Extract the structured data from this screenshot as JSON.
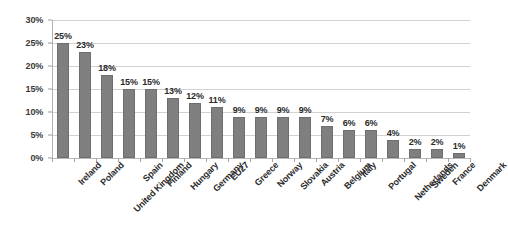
{
  "chart_data": {
    "type": "bar",
    "title": "",
    "subtitle": "",
    "xlabel": "",
    "ylabel": "",
    "ylim": [
      0,
      30
    ],
    "ytick_labels": [
      "0%",
      "5%",
      "10%",
      "15%",
      "20%",
      "25%",
      "30%"
    ],
    "ytick_values": [
      0,
      5,
      10,
      15,
      20,
      25,
      30
    ],
    "grid": true,
    "legend": null,
    "value_suffix": "%",
    "categories": [
      "Ireland",
      "Poland",
      "United Kingdom",
      "Spain",
      "Finland",
      "Hungary",
      "Germany",
      "EU27",
      "Greece",
      "Norway",
      "Slovakia",
      "Austria",
      "Belgium",
      "Italy",
      "Portugal",
      "Netherlands",
      "Sweden",
      "France",
      "Denmark"
    ],
    "values": [
      25,
      23,
      18,
      15,
      15,
      13,
      12,
      11,
      9,
      9,
      9,
      9,
      7,
      6,
      6,
      4,
      2,
      2,
      1
    ],
    "data_labels": [
      "25%",
      "23%",
      "18%",
      "15%",
      "15%",
      "13%",
      "12%",
      "11%",
      "9%",
      "9%",
      "9%",
      "9%",
      "7%",
      "6%",
      "6%",
      "4%",
      "2%",
      "2%",
      "1%"
    ],
    "colors": {
      "bar_fill": "#7f7f7f",
      "bar_stroke": "#6e6e6e",
      "gridline": "#d2d2d2",
      "axis": "#b0b0b0",
      "text": "#2b2b2b",
      "background": "#ffffff"
    }
  }
}
